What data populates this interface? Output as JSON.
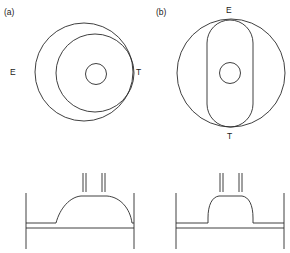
{
  "panels": [
    {
      "id": "a",
      "label": "(a)",
      "left_marker": "E",
      "right_marker": "T"
    },
    {
      "id": "b",
      "label": "(b)",
      "top_marker": "E",
      "bottom_marker": "T"
    }
  ],
  "colors": {
    "line": "#2a2a2a",
    "background": "#ffffff"
  }
}
